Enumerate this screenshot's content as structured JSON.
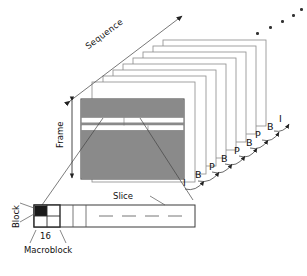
{
  "figure": {
    "type": "diagram",
    "background": "#ffffff",
    "frame_gray": "#8a8a8a",
    "outline": "#6e6e6e",
    "ink": "#111111"
  },
  "labels": {
    "sequence": "Sequence",
    "frame": "Frame",
    "slice": "Slice",
    "block": "Block",
    "macroblock": "Macroblock",
    "size": "16"
  },
  "gop": {
    "caption": "frame type sequence",
    "items": [
      {
        "type": "I",
        "x": 183,
        "y": 178
      },
      {
        "type": "B",
        "x": 195,
        "y": 170
      },
      {
        "type": "P",
        "x": 209,
        "y": 162
      },
      {
        "type": "B",
        "x": 221,
        "y": 154
      },
      {
        "type": "P",
        "x": 234,
        "y": 146
      },
      {
        "type": "B",
        "x": 246,
        "y": 138
      },
      {
        "type": "P",
        "x": 255,
        "y": 130
      },
      {
        "type": "B",
        "x": 267,
        "y": 122
      },
      {
        "type": "I",
        "x": 279,
        "y": 114
      }
    ]
  },
  "stack": {
    "frame_count": 9,
    "note": "white frames offset up-right"
  },
  "ellipsis_dots": {
    "count": 5,
    "points": [
      [
        256,
        32
      ],
      [
        269,
        26
      ],
      [
        281,
        20
      ],
      [
        292,
        14
      ],
      [
        300,
        8
      ]
    ]
  },
  "front_frame": {
    "bands": [
      {
        "kind": "gray",
        "height": 18
      },
      {
        "kind": "white",
        "height": 5
      },
      {
        "kind": "gray",
        "height": 3
      },
      {
        "kind": "white",
        "height": 5
      },
      {
        "kind": "gray",
        "height": 44
      }
    ]
  },
  "slice_strip": {
    "macroblock_cells": 4,
    "black_cell_index": 0,
    "dash_segments": 4
  }
}
